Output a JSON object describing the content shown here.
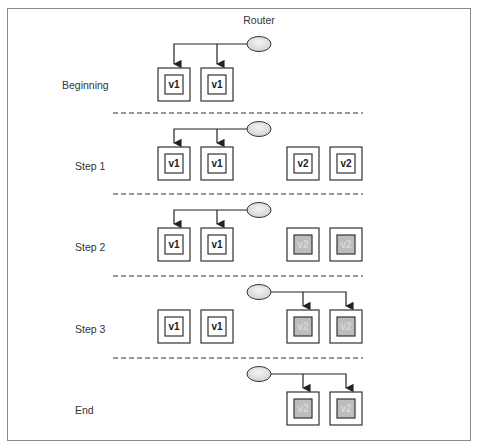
{
  "diagram": {
    "title": "Router",
    "colors": {
      "line": "#222222",
      "divider": "#333333",
      "frame": "#8a8a8a",
      "router_fill": "#e6e6e6",
      "highlight_fill": "#bdbdbd"
    },
    "rows": [
      {
        "label": "Beginning",
        "router_connected_to": [
          "v1",
          "v1"
        ],
        "instances": [
          {
            "version": "v1",
            "highlighted": false,
            "connected": true
          },
          {
            "version": "v1",
            "highlighted": false,
            "connected": true
          }
        ]
      },
      {
        "label": "Step 1",
        "instances": [
          {
            "version": "v1",
            "highlighted": false,
            "connected": true
          },
          {
            "version": "v1",
            "highlighted": false,
            "connected": true
          },
          {
            "version": "v2",
            "highlighted": false,
            "connected": false
          },
          {
            "version": "v2",
            "highlighted": false,
            "connected": false
          }
        ]
      },
      {
        "label": "Step 2",
        "instances": [
          {
            "version": "v1",
            "highlighted": false,
            "connected": true
          },
          {
            "version": "v1",
            "highlighted": false,
            "connected": true
          },
          {
            "version": "v2",
            "highlighted": true,
            "connected": false
          },
          {
            "version": "v2",
            "highlighted": true,
            "connected": false
          }
        ]
      },
      {
        "label": "Step 3",
        "instances": [
          {
            "version": "v1",
            "highlighted": false,
            "connected": false
          },
          {
            "version": "v1",
            "highlighted": false,
            "connected": false
          },
          {
            "version": "v2",
            "highlighted": true,
            "connected": true
          },
          {
            "version": "v2",
            "highlighted": true,
            "connected": true
          }
        ]
      },
      {
        "label": "End",
        "instances": [
          {
            "version": "v2",
            "highlighted": true,
            "connected": true
          },
          {
            "version": "v2",
            "highlighted": true,
            "connected": true
          }
        ]
      }
    ]
  }
}
